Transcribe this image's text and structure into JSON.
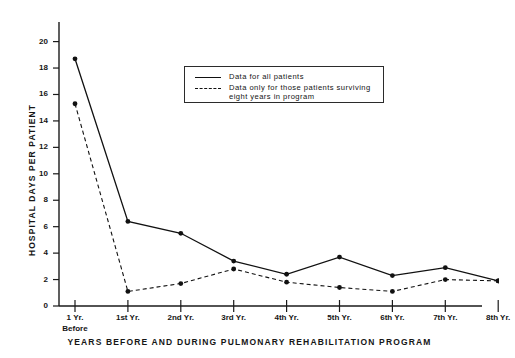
{
  "chart_data": {
    "type": "line",
    "title": "",
    "xlabel": "YEARS BEFORE AND DURING PULMONARY REHABILITATION PROGRAM",
    "ylabel": "HOSPITAL DAYS PER PATIENT",
    "categories": [
      "1 Yr. Before",
      "1st Yr.",
      "2nd Yr.",
      "3rd Yr.",
      "4th Yr.",
      "5th Yr.",
      "6th Yr.",
      "7th Yr.",
      "8th Yr."
    ],
    "category_labels": [
      {
        "main": "1 Yr.",
        "sub": "Before"
      },
      {
        "main": "1st Yr.",
        "sub": ""
      },
      {
        "main": "2nd Yr.",
        "sub": ""
      },
      {
        "main": "3rd Yr.",
        "sub": ""
      },
      {
        "main": "4th Yr.",
        "sub": ""
      },
      {
        "main": "5th Yr.",
        "sub": ""
      },
      {
        "main": "6th Yr.",
        "sub": ""
      },
      {
        "main": "7th Yr.",
        "sub": ""
      },
      {
        "main": "8th Yr.",
        "sub": ""
      }
    ],
    "ylim": [
      0,
      21
    ],
    "yticks": [
      0,
      2,
      4,
      6,
      8,
      10,
      12,
      14,
      16,
      18,
      20
    ],
    "grid": false,
    "legend_position": "upper-center",
    "series": [
      {
        "name": "Data for all patients",
        "style": "solid",
        "color": "#111111",
        "marker": "circle",
        "values": [
          18.7,
          6.4,
          5.5,
          3.4,
          2.4,
          3.7,
          2.3,
          2.9,
          1.9
        ]
      },
      {
        "name": "Data only for those patients surviving eight years in program",
        "style": "dashed",
        "color": "#111111",
        "marker": "circle",
        "values": [
          15.3,
          1.1,
          1.7,
          2.8,
          1.8,
          1.4,
          1.1,
          2.0,
          1.9
        ]
      }
    ]
  },
  "legend": {
    "entries": [
      {
        "line1": "Data for all patients",
        "line2": ""
      },
      {
        "line1": "Data only for those patients surviving",
        "line2": "eight years in program"
      }
    ]
  }
}
